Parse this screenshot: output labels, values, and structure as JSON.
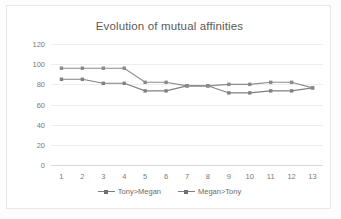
{
  "chart_data": {
    "type": "line",
    "title": "Evolution of mutual affinities",
    "xlabel": "",
    "ylabel": "",
    "x": [
      1,
      2,
      3,
      4,
      5,
      6,
      7,
      8,
      9,
      10,
      11,
      12,
      13
    ],
    "categories": [
      "1",
      "2",
      "3",
      "4",
      "5",
      "6",
      "7",
      "8",
      "9",
      "10",
      "11",
      "12",
      "13"
    ],
    "ylim": [
      0,
      120
    ],
    "yticks": [
      0,
      20,
      40,
      60,
      80,
      100,
      120
    ],
    "ytick_labels": [
      "0",
      "20",
      "40",
      "60",
      "80",
      "100",
      "120"
    ],
    "grid": true,
    "legend_position": "bottom",
    "series": [
      {
        "name": "Tony>Megan",
        "color": "#808080",
        "marker": "square",
        "values": [
          85,
          85,
          81,
          81,
          73.5,
          73.5,
          78.5,
          78.5,
          71.5,
          71.5,
          73.5,
          73.5,
          76.5
        ]
      },
      {
        "name": "Megan>Tony",
        "color": "#8a8a8a",
        "marker": "square",
        "values": [
          96,
          96,
          96,
          96,
          82,
          82,
          78.5,
          78.5,
          80,
          80,
          82,
          82,
          76.5
        ]
      }
    ]
  },
  "colors": {
    "plot_background": "#ffffff",
    "gridline": "#ededed",
    "axis": "#d9d9d9",
    "title_text": "#5a5a5a",
    "tick_text": "#7a7a7a",
    "series_1": "#808080",
    "series_2": "#8a8a8a"
  }
}
